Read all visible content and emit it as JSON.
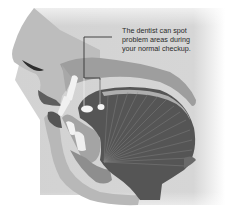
{
  "figure": {
    "callout": {
      "lines": [
        "The dentist can spot",
        "problem areas during",
        "your normal checkup."
      ]
    },
    "colors": {
      "background_shade": "#cfcfcf",
      "skin": "#b3b3b3",
      "palate": "#9a9a9a",
      "tongue": "#555555",
      "tongue_fibers": "#8a8a8a",
      "lip": "#6b6b6b",
      "teeth": "#f2f2f2",
      "leader_line": "#333333"
    }
  }
}
